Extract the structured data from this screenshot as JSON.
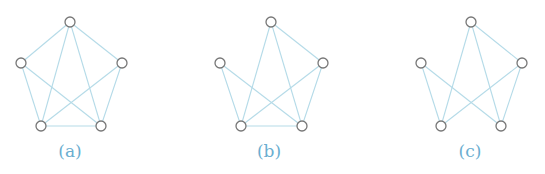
{
  "figure": {
    "edge_color": "#b5dbe8",
    "node_stroke": "#777777",
    "label_color": "#6aaed0",
    "node_radius": 5,
    "panels": [
      {
        "label": "(a)",
        "label_pos": [
          70,
          157
        ],
        "nodes": {
          "top": [
            70,
            22
          ],
          "left": [
            21,
            63
          ],
          "right": [
            122,
            63
          ],
          "bl": [
            41,
            126
          ],
          "br": [
            101,
            126
          ]
        },
        "edges": [
          [
            "top",
            "left"
          ],
          [
            "top",
            "right"
          ],
          [
            "top",
            "bl"
          ],
          [
            "top",
            "br"
          ],
          [
            "left",
            "bl"
          ],
          [
            "left",
            "br"
          ],
          [
            "right",
            "bl"
          ],
          [
            "right",
            "br"
          ],
          [
            "bl",
            "br"
          ]
        ]
      },
      {
        "label": "(b)",
        "label_pos": [
          269,
          157
        ],
        "nodes": {
          "top": [
            271,
            22
          ],
          "left": [
            220,
            63
          ],
          "right": [
            323,
            63
          ],
          "bl": [
            241,
            126
          ],
          "br": [
            302,
            126
          ]
        },
        "edges": [
          [
            "top",
            "right"
          ],
          [
            "top",
            "bl"
          ],
          [
            "top",
            "br"
          ],
          [
            "left",
            "bl"
          ],
          [
            "left",
            "br"
          ],
          [
            "right",
            "bl"
          ],
          [
            "right",
            "br"
          ],
          [
            "bl",
            "br"
          ]
        ]
      },
      {
        "label": "(c)",
        "label_pos": [
          470,
          157
        ],
        "nodes": {
          "top": [
            471,
            22
          ],
          "left": [
            421,
            63
          ],
          "right": [
            522,
            63
          ],
          "bl": [
            441,
            126
          ],
          "br": [
            501,
            126
          ]
        },
        "edges": [
          [
            "top",
            "right"
          ],
          [
            "top",
            "bl"
          ],
          [
            "top",
            "br"
          ],
          [
            "left",
            "bl"
          ],
          [
            "left",
            "br"
          ],
          [
            "right",
            "bl"
          ],
          [
            "right",
            "br"
          ]
        ]
      }
    ]
  }
}
